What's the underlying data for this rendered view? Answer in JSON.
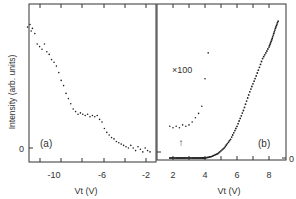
{
  "chart_data": [
    {
      "panel": "a",
      "type": "scatter",
      "title": "",
      "panel_label": "(a)",
      "xlabel": "V_t (V)",
      "ylabel": "Intensity (arb. units)",
      "xlim": [
        -13,
        -1.5
      ],
      "x_ticks": [
        -10,
        -6,
        -2
      ],
      "y_ticks": [
        "0"
      ],
      "grid": false,
      "series": [
        {
          "name": "panel a",
          "x": [
            -12.2,
            -12.0,
            -11.9,
            -11.8,
            -11.6,
            -11.4,
            -11.2,
            -11.0,
            -10.8,
            -10.6,
            -10.4,
            -10.2,
            -10.0,
            -9.8,
            -9.6,
            -9.4,
            -9.2,
            -9.0,
            -8.8,
            -8.6,
            -8.4,
            -8.2,
            -8.0,
            -7.8,
            -7.6,
            -7.4,
            -7.2,
            -7.0,
            -6.8,
            -6.6,
            -6.4,
            -6.2,
            -6.0,
            -5.8,
            -5.6,
            -5.4,
            -5.2,
            -5.0,
            -4.8,
            -4.6,
            -4.4,
            -4.2,
            -4.0,
            -3.8,
            -3.6,
            -3.4,
            -3.2,
            -3.0,
            -2.8,
            -2.6,
            -2.4,
            -2.2,
            -2.0
          ],
          "y": [
            0.93,
            0.95,
            0.9,
            0.92,
            0.88,
            0.8,
            0.78,
            0.76,
            0.8,
            0.74,
            0.72,
            0.68,
            0.66,
            0.63,
            0.58,
            0.52,
            0.48,
            0.42,
            0.38,
            0.34,
            0.3,
            0.28,
            0.26,
            0.27,
            0.26,
            0.25,
            0.26,
            0.24,
            0.25,
            0.24,
            0.25,
            0.22,
            0.2,
            0.15,
            0.12,
            0.1,
            0.08,
            0.07,
            0.05,
            0.04,
            0.03,
            0.02,
            0.01,
            0.0,
            0.02,
            0.0,
            -0.02,
            0.01,
            -0.01,
            -0.03,
            0.0,
            -0.02,
            -0.03
          ]
        }
      ]
    },
    {
      "panel": "b",
      "type": "scatter",
      "title": "",
      "panel_label": "(b)",
      "xlabel": "V_t (V)",
      "ylabel": "",
      "xlim": [
        1.5,
        9.0
      ],
      "x_ticks": [
        2,
        4,
        6,
        8
      ],
      "y_ticks": [
        "0"
      ],
      "grid": false,
      "annotations": [
        "×100",
        "↑"
      ],
      "series": [
        {
          "name": "main curve",
          "x": [
            1.8,
            2.2,
            2.6,
            3.0,
            3.4,
            3.8,
            4.0,
            4.4,
            4.8,
            5.2,
            5.6,
            6.0,
            6.4,
            6.8,
            7.2,
            7.6,
            8.0,
            8.2,
            8.4,
            8.6
          ],
          "y": [
            0.0,
            0.0,
            0.0,
            0.0,
            0.0,
            0.0,
            0.0,
            0.01,
            0.03,
            0.07,
            0.13,
            0.22,
            0.33,
            0.46,
            0.57,
            0.69,
            0.77,
            0.83,
            0.9,
            0.96
          ]
        },
        {
          "name": "x100 magnified",
          "x": [
            1.8,
            2.0,
            2.2,
            2.4,
            2.6,
            2.8,
            3.0,
            3.2,
            3.4,
            3.6,
            3.8,
            4.0,
            4.2
          ],
          "y": [
            0.22,
            0.21,
            0.22,
            0.21,
            0.23,
            0.22,
            0.23,
            0.25,
            0.28,
            0.31,
            0.36,
            0.55,
            0.73
          ]
        }
      ]
    }
  ],
  "labels": {
    "ylabel": "Intensity (arb. units)",
    "panel_a": "(a)",
    "panel_b": "(b)",
    "xlabel_a": "Vt (V)",
    "xlabel_b": "Vt (V)",
    "magnification": "×100",
    "arrow": "↑",
    "zero_a": "0",
    "zero_b": "0",
    "xtick_a": [
      "-10",
      "-6",
      "-2"
    ],
    "xtick_b": [
      "2",
      "4",
      "6",
      "8"
    ]
  }
}
